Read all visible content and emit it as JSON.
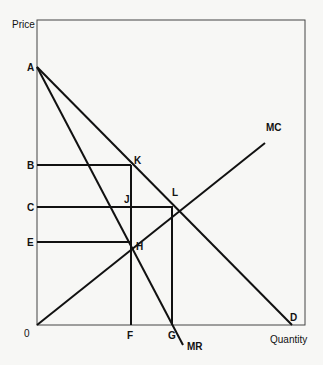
{
  "diagram": {
    "axes": {
      "y_label": "Price",
      "x_label": "Quantity",
      "origin_label": "0"
    },
    "curves": [
      {
        "id": "D",
        "label": "D",
        "desc": "Demand curve from A to D"
      },
      {
        "id": "MR",
        "label": "MR",
        "desc": "Marginal revenue curve from A"
      },
      {
        "id": "MC",
        "label": "MC",
        "desc": "Marginal cost curve from origin"
      }
    ],
    "price_labels": {
      "a": "A",
      "b": "B",
      "c": "C",
      "e": "E"
    },
    "quantity_labels": {
      "f": "F",
      "g": "G"
    },
    "points": {
      "k": "K",
      "l": "L",
      "j": "J",
      "h": "H"
    },
    "colors": {
      "line": "#111111",
      "frame": "#333333",
      "background": "#f7f7f5"
    }
  }
}
